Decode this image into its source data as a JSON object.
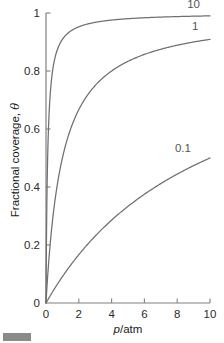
{
  "chart_data": {
    "type": "line",
    "title": "",
    "subtitle": "",
    "xlabel": "p/atm",
    "xlabel_italic_part": "p",
    "xlabel_rest": "/atm",
    "ylabel": "Fractional coverage, θ",
    "ylabel_text_part": "Fractional coverage, ",
    "ylabel_symbol": "θ",
    "xlim": [
      0,
      10
    ],
    "ylim": [
      0,
      1
    ],
    "xticks": [
      0,
      2,
      4,
      6,
      8,
      10
    ],
    "xticklabels": [
      "0",
      "2",
      "4",
      "6",
      "8",
      "10"
    ],
    "yticks": [
      0,
      0.2,
      0.4,
      0.6,
      0.8,
      1
    ],
    "yticklabels": [
      "0",
      "0.2",
      "0.4",
      "0.6",
      "0.8",
      "1"
    ],
    "grid": false,
    "legend_position": "inline-annotations",
    "equation": "theta = K*p/(1+K*p)",
    "line_color": "#6f6f6f",
    "axis_color": "#808080",
    "background_color": "#ffffff",
    "series": [
      {
        "name": "10",
        "K": 10,
        "label": "10",
        "label_x": 9.0,
        "label_y": 1.03,
        "x": [
          0,
          0.05,
          0.1,
          0.15,
          0.2,
          0.3,
          0.4,
          0.5,
          0.75,
          1.0,
          1.5,
          2.0,
          2.5,
          3.0,
          4.0,
          5.0,
          6.0,
          7.0,
          8.0,
          9.0,
          10.0
        ],
        "y": [
          0,
          0.333,
          0.5,
          0.6,
          0.667,
          0.75,
          0.8,
          0.833,
          0.882,
          0.909,
          0.938,
          0.952,
          0.962,
          0.968,
          0.976,
          0.98,
          0.984,
          0.986,
          0.988,
          0.989,
          0.99
        ]
      },
      {
        "name": "1",
        "K": 1,
        "label": "1",
        "label_x": 9.1,
        "label_y": 0.955,
        "x": [
          0,
          0.1,
          0.25,
          0.5,
          0.75,
          1.0,
          1.5,
          2.0,
          2.5,
          3.0,
          3.5,
          4.0,
          5.0,
          6.0,
          7.0,
          8.0,
          9.0,
          10.0
        ],
        "y": [
          0,
          0.091,
          0.2,
          0.333,
          0.429,
          0.5,
          0.6,
          0.667,
          0.714,
          0.75,
          0.778,
          0.8,
          0.833,
          0.857,
          0.875,
          0.889,
          0.9,
          0.909
        ]
      },
      {
        "name": "0.1",
        "K": 0.1,
        "label": "0.1",
        "label_x": 8.35,
        "label_y": 0.535,
        "x": [
          0,
          0.5,
          1.0,
          1.5,
          2.0,
          2.5,
          3.0,
          3.5,
          4.0,
          5.0,
          6.0,
          7.0,
          8.0,
          9.0,
          10.0
        ],
        "y": [
          0,
          0.048,
          0.091,
          0.13,
          0.167,
          0.2,
          0.231,
          0.259,
          0.286,
          0.333,
          0.375,
          0.412,
          0.444,
          0.474,
          0.5
        ]
      }
    ]
  },
  "figure": {
    "corner_mark": "gray-bar-artifact"
  }
}
